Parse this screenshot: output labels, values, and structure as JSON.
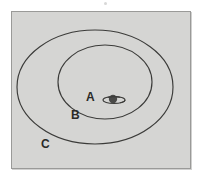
{
  "figure": {
    "kind": "concentric-ellipse-diagram",
    "background_color": "#ffffff",
    "plate_color": "#d5d5d3",
    "frame_border_color": "#9a9a98",
    "line_color": "#3b3b39",
    "label_color": "#2a2a28"
  },
  "regions": [
    {
      "id": "a",
      "label": "A",
      "name": "innermost-region",
      "icon": "ringed-planet-icon"
    },
    {
      "id": "b",
      "label": "B",
      "name": "middle-ellipse-region"
    },
    {
      "id": "c",
      "label": "C",
      "name": "outer-ellipse-region"
    }
  ],
  "ellipses": [
    {
      "id": "inner",
      "cx": 93,
      "cy": 70,
      "rx": 47,
      "ry": 37
    },
    {
      "id": "outer",
      "cx": 83,
      "cy": 75,
      "rx": 78,
      "ry": 57
    }
  ],
  "planet": {
    "name": "ringed-planet-icon",
    "body_color": "#4a4a48",
    "ring_color": "#3b3b39"
  }
}
